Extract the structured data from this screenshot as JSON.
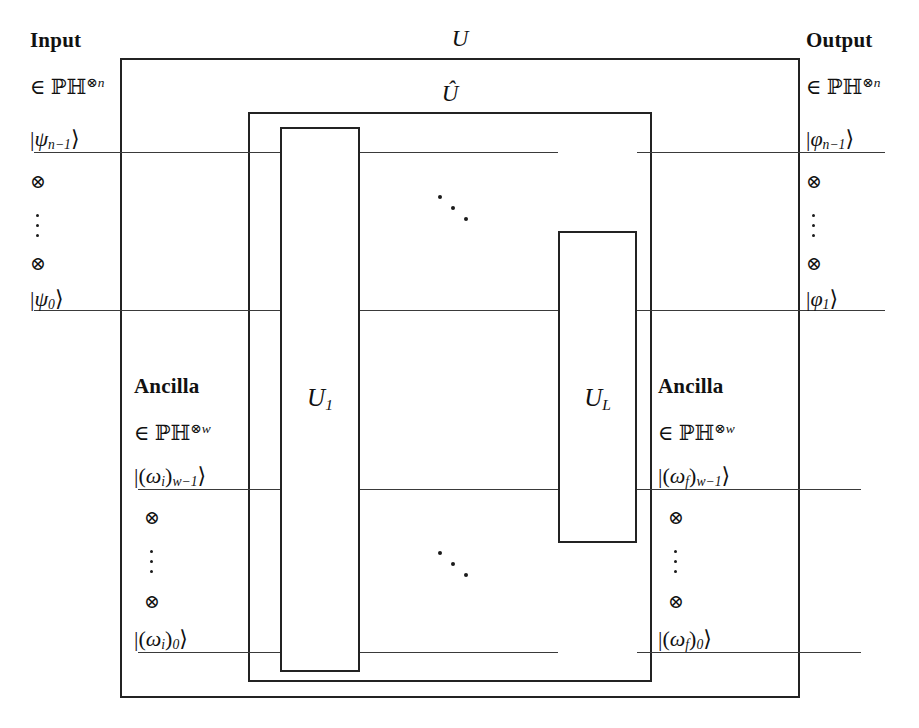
{
  "diagram": {
    "title_top": "U",
    "title_inner": "Û",
    "gates": [
      {
        "label": "U",
        "sub": "1",
        "name": "gate-u1"
      },
      {
        "label": "U",
        "sub": "L",
        "name": "gate-ul"
      }
    ],
    "input": {
      "heading": "Input",
      "space_prefix": "∈",
      "space_symbol": "ℙℍ",
      "space_exponent": "⊗n",
      "ket_top": {
        "bar": "|",
        "symbol": "ψ",
        "sub": "n−1",
        "ang": "⟩"
      },
      "tensor": "⊗",
      "ket_bottom": {
        "bar": "|",
        "symbol": "ψ",
        "sub": "0",
        "ang": "⟩"
      }
    },
    "output": {
      "heading": "Output",
      "space_prefix": "∈",
      "space_symbol": "ℙℍ",
      "space_exponent": "⊗n",
      "ket_top": {
        "bar": "|",
        "symbol": "φ",
        "sub": "n−1",
        "ang": "⟩"
      },
      "tensor": "⊗",
      "ket_bottom": {
        "bar": "|",
        "symbol": "φ",
        "sub": "1",
        "ang": "⟩"
      }
    },
    "ancilla_in": {
      "heading": "Ancilla",
      "space_prefix": "∈",
      "space_symbol": "ℙℍ",
      "space_exponent": "⊗w",
      "ket_top": {
        "bar": "|(",
        "symbol": "ω",
        "symbol_sub": "i",
        "close": ")",
        "sub": "w−1",
        "ang": "⟩"
      },
      "tensor": "⊗",
      "ket_bottom": {
        "bar": "|(",
        "symbol": "ω",
        "symbol_sub": "i",
        "close": ")",
        "sub": "0",
        "ang": "⟩"
      }
    },
    "ancilla_out": {
      "heading": "Ancilla",
      "space_prefix": "∈",
      "space_symbol": "ℙℍ",
      "space_exponent": "⊗w",
      "ket_top": {
        "bar": "|(",
        "symbol": "ω",
        "symbol_sub": "f",
        "close": ")",
        "sub": "w−1",
        "ang": "⟩"
      },
      "tensor": "⊗",
      "ket_bottom": {
        "bar": "|(",
        "symbol": "ω",
        "symbol_sub": "f",
        "close": ")",
        "sub": "0",
        "ang": "⟩"
      }
    },
    "colors": {
      "ink": "#232323",
      "wire": "#3a3a3a",
      "background": "#ffffff"
    }
  }
}
